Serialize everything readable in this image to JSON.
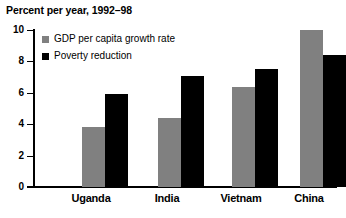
{
  "chart_data": {
    "type": "bar",
    "title": "Percent per year, 1992–98",
    "xlabel": "",
    "ylabel": "",
    "ylim": [
      0,
      10
    ],
    "yticks": [
      0,
      2,
      4,
      6,
      8,
      10
    ],
    "grid": false,
    "legend_position": "inside-top-left",
    "categories": [
      "Uganda",
      "India",
      "Vietnam",
      "China"
    ],
    "series": [
      {
        "name": "GDP per capita growth rate",
        "color": "#808080",
        "values": [
          3.8,
          4.4,
          6.4,
          10.0
        ]
      },
      {
        "name": "Poverty reduction",
        "color": "#000000",
        "values": [
          5.9,
          7.1,
          7.5,
          8.4
        ]
      }
    ]
  },
  "ytick_labels": {
    "t0": "0",
    "t2": "2",
    "t4": "4",
    "t6": "6",
    "t8": "8",
    "t10": "10"
  },
  "legend": {
    "item0": "GDP per capita growth rate",
    "item1": "Poverty reduction"
  },
  "categories": {
    "c0": "Uganda",
    "c1": "India",
    "c2": "Vietnam",
    "c3": "China"
  }
}
